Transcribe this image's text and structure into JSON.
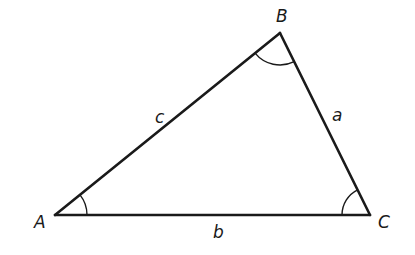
{
  "diagram": {
    "type": "triangle",
    "stroke_color": "#1a1a1a",
    "vertices": [
      {
        "id": "A",
        "label": "A",
        "x": 55,
        "y": 215
      },
      {
        "id": "B",
        "label": "B",
        "x": 280,
        "y": 33
      },
      {
        "id": "C",
        "label": "C",
        "x": 370,
        "y": 215
      }
    ],
    "sides": [
      {
        "id": "a",
        "label": "a",
        "from": "B",
        "to": "C"
      },
      {
        "id": "b",
        "label": "b",
        "from": "A",
        "to": "C"
      },
      {
        "id": "c",
        "label": "c",
        "from": "A",
        "to": "B"
      }
    ],
    "angle_marks": [
      "A",
      "B",
      "C"
    ]
  }
}
